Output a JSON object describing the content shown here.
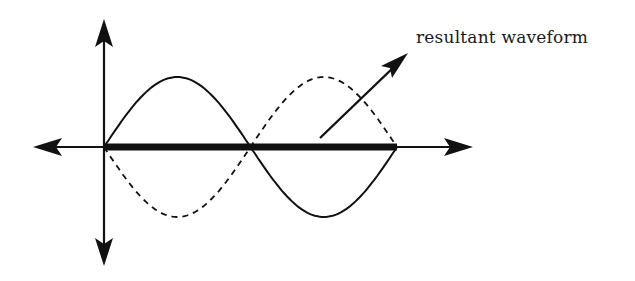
{
  "diagram": {
    "annotation": {
      "label": "resultant waveform",
      "x": 416,
      "y": 27
    },
    "colors": {
      "background": "#ffffff",
      "stroke": "#111111"
    },
    "axes": {
      "origin": [
        104,
        147
      ],
      "vertical": {
        "x": 104,
        "top": 20,
        "bottom": 265
      },
      "horizontal": {
        "y": 147,
        "left": 33,
        "right": 472
      }
    },
    "waves": [
      {
        "name": "wave-1",
        "style": "solid",
        "start_x": 104,
        "end_x": 397,
        "amplitude": 70,
        "phase": 0
      },
      {
        "name": "wave-2",
        "style": "dashed",
        "start_x": 104,
        "end_x": 397,
        "amplitude": 70,
        "phase": 180
      }
    ],
    "resultant": {
      "style": "thick",
      "start_x": 104,
      "end_x": 397,
      "y": 147,
      "amplitude": 0
    },
    "pointer": {
      "from": [
        320,
        138
      ],
      "to": [
        407,
        54
      ]
    }
  }
}
